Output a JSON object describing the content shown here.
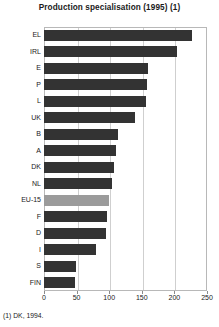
{
  "chart": {
    "title": "Production specialisation (1995) (1)",
    "footnote": "(1) DK, 1994."
  },
  "chart_data": {
    "type": "bar",
    "orientation": "horizontal",
    "title": "Production specialisation (1995) (1)",
    "xlabel": "",
    "ylabel": "",
    "xlim": [
      0,
      250
    ],
    "xticks": [
      0,
      50,
      100,
      150,
      200,
      250
    ],
    "grid": true,
    "legend": "none",
    "bar_color": "#333333",
    "highlight_color": "#9b9b9b",
    "highlight_category": "EU-15",
    "categories": [
      "EL",
      "IRL",
      "E",
      "P",
      "L",
      "UK",
      "B",
      "A",
      "DK",
      "NL",
      "EU-15",
      "F",
      "D",
      "I",
      "S",
      "FIN"
    ],
    "values": [
      227,
      204,
      160,
      158,
      157,
      139,
      113,
      110,
      107,
      104,
      100,
      96,
      95,
      80,
      49,
      48
    ],
    "annotations": [
      "(1) DK, 1994."
    ]
  }
}
